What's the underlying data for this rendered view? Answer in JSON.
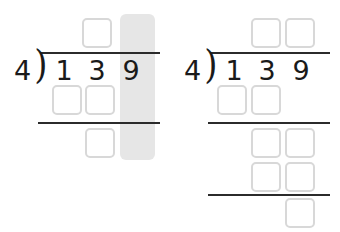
{
  "worksheet": {
    "title": "Long division worksheet: 139 divided by 4",
    "accent_box_border": "#d8d8d8",
    "ink_color": "#1a1a1a",
    "highlight_color": "#e6e6e6"
  },
  "problems": [
    {
      "id": "left",
      "label": "partially-worked-long-division",
      "divisor": "4",
      "bracket": ")",
      "dividend_digits": [
        "1",
        "3",
        "9"
      ],
      "highlight": {
        "column_label": "ones-column",
        "x": 120,
        "y": 14,
        "width": 35,
        "height": 146,
        "color": "#e6e6e6"
      },
      "boxes": [
        {
          "name": "quotient-box-1",
          "x": 82,
          "y": 18,
          "value": ""
        },
        {
          "name": "product-box-1",
          "x": 52,
          "y": 85,
          "value": ""
        },
        {
          "name": "product-box-2",
          "x": 85,
          "y": 85,
          "value": ""
        },
        {
          "name": "remainder-box-1",
          "x": 85,
          "y": 128,
          "value": ""
        }
      ],
      "rules": [
        {
          "name": "vinculum",
          "x": 40,
          "y": 52,
          "width": 120
        },
        {
          "name": "subtraction-rule-1",
          "x": 38,
          "y": 122,
          "width": 122
        }
      ]
    },
    {
      "id": "right",
      "label": "blank-long-division",
      "divisor": "4",
      "bracket": ")",
      "dividend_digits": [
        "1",
        "3",
        "9"
      ],
      "highlight": null,
      "boxes": [
        {
          "name": "quotient-box-1",
          "x": 81,
          "y": 18,
          "value": ""
        },
        {
          "name": "quotient-box-2",
          "x": 115,
          "y": 18,
          "value": ""
        },
        {
          "name": "product-box-1",
          "x": 47,
          "y": 85,
          "value": ""
        },
        {
          "name": "product-box-2",
          "x": 81,
          "y": 85,
          "value": ""
        },
        {
          "name": "bringdown-box-1",
          "x": 81,
          "y": 128,
          "value": ""
        },
        {
          "name": "bringdown-box-2",
          "x": 115,
          "y": 128,
          "value": ""
        },
        {
          "name": "product2-box-1",
          "x": 81,
          "y": 162,
          "value": ""
        },
        {
          "name": "product2-box-2",
          "x": 115,
          "y": 162,
          "value": ""
        },
        {
          "name": "remainder-box-1",
          "x": 115,
          "y": 198,
          "value": ""
        }
      ],
      "rules": [
        {
          "name": "vinculum",
          "x": 40,
          "y": 52,
          "width": 120
        },
        {
          "name": "subtraction-rule-1",
          "x": 38,
          "y": 122,
          "width": 122
        },
        {
          "name": "subtraction-rule-2",
          "x": 38,
          "y": 194,
          "width": 122
        }
      ]
    }
  ],
  "geometry": {
    "divisor_x": 14,
    "divisor_y": 57,
    "bracket_x": 33,
    "bracket_y": 48,
    "digit_y": 57,
    "digit_x": [
      51,
      84,
      118
    ]
  }
}
